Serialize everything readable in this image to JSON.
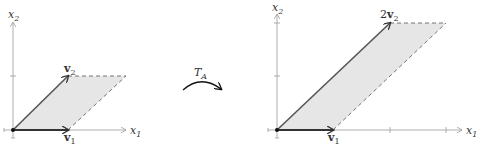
{
  "left_diagram": {
    "x_axis_label": "x",
    "x_axis_sub": "1",
    "y_axis_label": "x",
    "y_axis_sub": "2",
    "vector1_label": "v",
    "vector1_sub": "1",
    "vector2_label": "v",
    "vector2_sub": "2"
  },
  "transform": {
    "label": "T",
    "label_sub": "A"
  },
  "right_diagram": {
    "x_axis_label": "x",
    "x_axis_sub": "1",
    "y_axis_label": "x",
    "y_axis_sub": "2",
    "vector1_label": "v",
    "vector1_sub": "1",
    "vector2_coef": "2",
    "vector2_label": "v",
    "vector2_sub": "2"
  },
  "colors": {
    "fill": "#e4e4e4",
    "vector": "#444444",
    "axis": "#999999",
    "dashed": "#666666"
  }
}
